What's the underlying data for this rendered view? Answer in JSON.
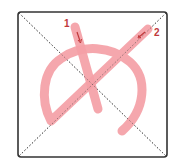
{
  "diagram": {
    "type": "stroke-order",
    "stroke_count": 2,
    "stroke_color": "#f4a0a6",
    "arrow_color": "#c0393b",
    "label_color": "#c0393b",
    "frame_color": "#333333",
    "guide_color": "#555555",
    "strokes": [
      {
        "number": "1",
        "description": "short slanted downward stroke"
      },
      {
        "number": "2",
        "description": "long diagonal continuing into an arc with hook"
      }
    ],
    "labels": {
      "stroke1": "1",
      "stroke2": "2"
    }
  }
}
